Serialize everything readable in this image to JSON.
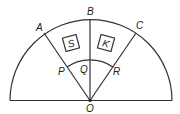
{
  "diagram": {
    "type": "semicircle-sectors",
    "labels": {
      "A": "A",
      "B": "B",
      "C": "C",
      "P": "P",
      "Q": "Q",
      "R": "R",
      "O": "O",
      "S": "S",
      "K": "K"
    },
    "colors": {
      "stroke": "#333333",
      "text": "#222222",
      "background": "#ffffff"
    }
  }
}
